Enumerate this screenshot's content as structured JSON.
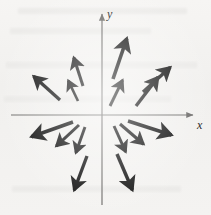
{
  "figure": {
    "background_color": "#f3f2f0",
    "ink_color": "#141414",
    "axis_color": "#6d6c6a"
  },
  "axes": {
    "x_label": "x",
    "y_label": "y",
    "origin": {
      "x": 102,
      "y": 115
    },
    "x_axis": {
      "x1": 11,
      "y1": 115,
      "x2": 193,
      "y2": 115,
      "arrow": "right"
    },
    "y_axis": {
      "x1": 102,
      "y1": 205,
      "x2": 102,
      "y2": 14,
      "arrow": "up"
    }
  },
  "chart_data": {
    "type": "scatter",
    "xlabel": "x",
    "ylabel": "y",
    "grid": false,
    "legend": "none",
    "arrow_count": 14,
    "arrows": [
      {
        "id": "q1-a",
        "quadrant": 1,
        "x1": 113,
        "y1": 79,
        "x2": 129,
        "y2": 32,
        "angle_deg": 71
      },
      {
        "id": "q1-b",
        "quadrant": 1,
        "x1": 110,
        "y1": 106,
        "x2": 125,
        "y2": 75,
        "angle_deg": 64
      },
      {
        "id": "q1-c",
        "quadrant": 1,
        "x1": 136,
        "y1": 106,
        "x2": 162,
        "y2": 72,
        "angle_deg": 53
      },
      {
        "id": "q1-d",
        "quadrant": 1,
        "x1": 143,
        "y1": 92,
        "x2": 175,
        "y2": 63,
        "angle_deg": 42
      },
      {
        "id": "q2-a",
        "quadrant": 2,
        "x1": 83,
        "y1": 86,
        "x2": 72,
        "y2": 52,
        "angle_deg": 108
      },
      {
        "id": "q2-b",
        "quadrant": 2,
        "x1": 78,
        "y1": 101,
        "x2": 66,
        "y2": 76,
        "angle_deg": 116
      },
      {
        "id": "q2-c",
        "quadrant": 2,
        "x1": 60,
        "y1": 100,
        "x2": 29,
        "y2": 72,
        "angle_deg": 138
      },
      {
        "id": "q3-a",
        "quadrant": 3,
        "x1": 85,
        "y1": 127,
        "x2": 74,
        "y2": 158,
        "angle_deg": 250
      },
      {
        "id": "q3-b",
        "quadrant": 3,
        "x1": 79,
        "y1": 125,
        "x2": 52,
        "y2": 150,
        "angle_deg": 222
      },
      {
        "id": "q3-c",
        "quadrant": 3,
        "x1": 73,
        "y1": 122,
        "x2": 25,
        "y2": 139,
        "angle_deg": 200
      },
      {
        "id": "q3-d",
        "quadrant": 3,
        "x1": 87,
        "y1": 156,
        "x2": 72,
        "y2": 196,
        "angle_deg": 250
      },
      {
        "id": "q4-a",
        "quadrant": 4,
        "x1": 114,
        "y1": 126,
        "x2": 128,
        "y2": 157,
        "angle_deg": 294
      },
      {
        "id": "q4-b",
        "quadrant": 4,
        "x1": 120,
        "y1": 124,
        "x2": 148,
        "y2": 148,
        "angle_deg": 320
      },
      {
        "id": "q4-c",
        "quadrant": 4,
        "x1": 128,
        "y1": 121,
        "x2": 178,
        "y2": 137,
        "angle_deg": 342
      },
      {
        "id": "q4-d",
        "quadrant": 4,
        "x1": 117,
        "y1": 154,
        "x2": 135,
        "y2": 196,
        "angle_deg": 293
      }
    ]
  }
}
